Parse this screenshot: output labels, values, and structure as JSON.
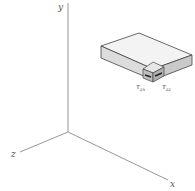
{
  "diagram": {
    "type": "3d-axes-with-stress-element",
    "axes": {
      "origin": [
        68,
        132
      ],
      "y": {
        "label": "y",
        "end": [
          68,
          3
        ]
      },
      "z": {
        "label": "z",
        "end": [
          18,
          152
        ]
      },
      "x": {
        "label": "x",
        "end": [
          170,
          181
        ]
      }
    },
    "block": {
      "top_face_color": "#f2f2f2",
      "front_face_color": "#d9d9d9",
      "side_face_color": "#c8c8c8",
      "edge_color": "#444444"
    },
    "labels": {
      "tau_zx": {
        "base": "τ",
        "sub": "zx"
      },
      "tau_zz": {
        "base": "τ",
        "sub": "zz"
      }
    },
    "colors": {
      "axis": "#888888",
      "text": "#555555"
    }
  }
}
